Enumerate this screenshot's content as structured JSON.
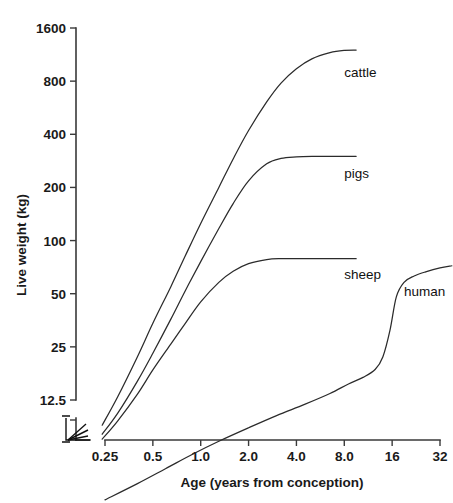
{
  "chart_data": {
    "type": "line",
    "title": "",
    "xlabel": "Age (years from conception)",
    "ylabel": "Live weight (kg)",
    "xscale": "log2",
    "yscale": "log2",
    "xticks": [
      "0.25",
      "0.5",
      "1.0",
      "2.0",
      "4.0",
      "8.0",
      "16",
      "32"
    ],
    "xtick_values": [
      0.25,
      0.5,
      1.0,
      2.0,
      4.0,
      8.0,
      16,
      32
    ],
    "yticks": [
      "12.5",
      "25",
      "50",
      "100",
      "200",
      "400",
      "800",
      "1600"
    ],
    "ytick_values": [
      12.5,
      25,
      50,
      100,
      200,
      400,
      800,
      1600
    ],
    "xlim": [
      0.25,
      32
    ],
    "ylim": [
      12.5,
      1600
    ],
    "grid": false,
    "legend": "inline-labels",
    "axis_break": true,
    "axis_break_note": "origin broken on both axes",
    "series": [
      {
        "name": "cattle",
        "label": "cattle",
        "label_x": 8.0,
        "label_y": 900,
        "x": [
          0.24,
          0.3,
          0.4,
          0.5,
          0.65,
          0.8,
          1.0,
          1.3,
          1.6,
          2.0,
          2.6,
          3.2,
          4.0,
          5.0,
          6.5,
          8.0,
          9.5
        ],
        "y": [
          9,
          13,
          22,
          34,
          55,
          82,
          125,
          200,
          290,
          420,
          610,
          780,
          940,
          1070,
          1160,
          1195,
          1200
        ]
      },
      {
        "name": "pigs",
        "label": "pigs",
        "label_x": 8.0,
        "label_y": 240,
        "x": [
          0.24,
          0.3,
          0.4,
          0.5,
          0.65,
          0.8,
          1.0,
          1.3,
          1.6,
          2.0,
          2.6,
          3.2,
          4.0,
          5.0,
          6.5,
          8.0,
          9.5
        ],
        "y": [
          8,
          10.5,
          16,
          23,
          36,
          52,
          76,
          117,
          162,
          218,
          272,
          292,
          298,
          300,
          300,
          300,
          300
        ]
      },
      {
        "name": "sheep",
        "label": "sheep",
        "label_x": 8.0,
        "label_y": 65,
        "x": [
          0.24,
          0.3,
          0.4,
          0.5,
          0.65,
          0.8,
          1.0,
          1.3,
          1.6,
          2.0,
          2.6,
          3.2,
          4.0,
          5.0,
          6.5,
          8.0,
          9.5
        ],
        "y": [
          7.5,
          9.5,
          13.5,
          18.5,
          26,
          34,
          45,
          58,
          67,
          74,
          78,
          79,
          79,
          79,
          79,
          79,
          79
        ]
      },
      {
        "name": "human",
        "label": "human",
        "label_x": 19,
        "label_y": 52,
        "x": [
          0.25,
          0.4,
          0.6,
          0.9,
          1.3,
          2.0,
          3.0,
          4.5,
          6.5,
          8.5,
          10.5,
          12.5,
          14.0,
          15.5,
          17.0,
          19.0,
          22.0,
          26.0,
          32.0,
          38.0
        ],
        "y": [
          3.4,
          4.2,
          5.1,
          6.2,
          7.3,
          8.7,
          10.2,
          11.8,
          13.6,
          15.4,
          16.8,
          18.6,
          22.0,
          31.0,
          48.0,
          58.0,
          63.0,
          66.5,
          70.0,
          72.0
        ]
      }
    ]
  },
  "colors": {
    "background": "#ffffff",
    "axis": "#3a3a3a",
    "curve": "#2b2b2b",
    "text": "#1a1a1a"
  }
}
